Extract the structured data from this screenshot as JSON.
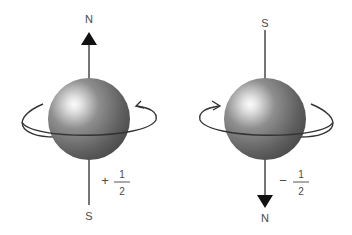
{
  "diagram": {
    "spin_up": {
      "top_label": "N",
      "bottom_label": "S",
      "sign": "+",
      "numerator": "1",
      "denominator": "2",
      "rotation": "counterclockwise (viewed from top)"
    },
    "spin_down": {
      "top_label": "S",
      "bottom_label": "N",
      "sign": "−",
      "numerator": "1",
      "denominator": "2",
      "rotation": "clockwise (viewed from top)"
    },
    "colors": {
      "sphere_dark": "#5a5a5a",
      "sphere_light": "#f4f4f4",
      "line": "#3a3a3a",
      "text": "#4a4a4a",
      "arrowhead": "#111111"
    }
  }
}
